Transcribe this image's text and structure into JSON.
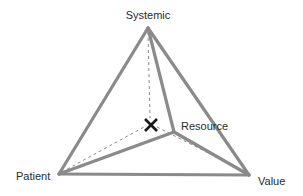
{
  "diagram": {
    "type": "tetrahedron",
    "vertices": {
      "systemic": {
        "label": "Systemic",
        "x": 148,
        "y": 28
      },
      "patient": {
        "label": "Patient",
        "x": 59,
        "y": 174
      },
      "value": {
        "label": "Value",
        "x": 249,
        "y": 175
      },
      "resource": {
        "label": "Resource",
        "x": 174,
        "y": 132
      }
    },
    "marker": {
      "symbol": "x-marker",
      "x": 151,
      "y": 125
    },
    "colors": {
      "edge": "#8a8a8a",
      "marker": "#1a1a1a",
      "text": "#2a2a2a",
      "background": "#ffffff"
    }
  }
}
